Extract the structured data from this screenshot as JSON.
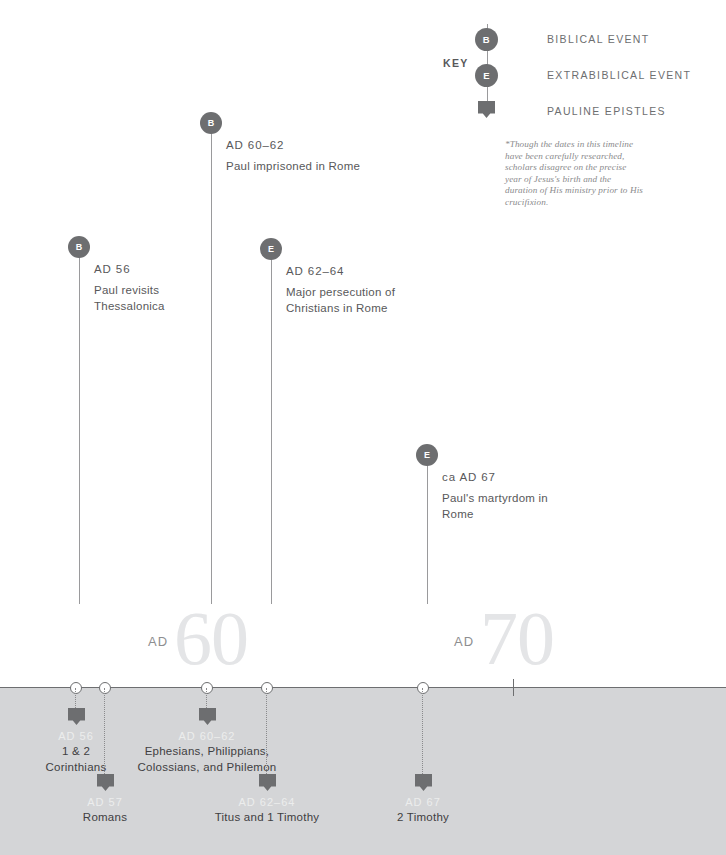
{
  "key": {
    "label": "KEY",
    "items": [
      {
        "icon": "biblical-event-badge",
        "glyph": "B",
        "text": "BIBLICAL EVENT"
      },
      {
        "icon": "extrabiblical-event-badge",
        "glyph": "E",
        "text": "EXTRABIBLICAL EVENT"
      },
      {
        "icon": "pauline-epistle-shield",
        "glyph": "",
        "text": "PAULINE EPISTLES"
      }
    ]
  },
  "footnote": "*Though the dates in this timeline have been carefully researched, scholars disagree on the precise year of Jesus's birth and the duration of His ministry prior to His crucifixion.",
  "events": [
    {
      "id": "paul-imprisoned-rome",
      "type": "B",
      "date": "AD 60–62",
      "description": "Paul imprisoned in Rome",
      "x": 200,
      "y": 112,
      "stem_height": 482
    },
    {
      "id": "paul-revisits-thessalonica",
      "type": "B",
      "date": "AD 56",
      "description": "Paul revisits Thessalonica",
      "x": 68,
      "y": 236,
      "stem_height": 358
    },
    {
      "id": "major-persecution-christians-rome",
      "type": "E",
      "date": "AD 62–64",
      "description": "Major persecution of Christians in Rome",
      "x": 260,
      "y": 238,
      "stem_height": 356
    },
    {
      "id": "pauls-martyrdom-rome",
      "type": "E",
      "date": "ca AD 67",
      "description": "Paul's martyrdom in Rome",
      "x": 416,
      "y": 444,
      "stem_height": 150
    }
  ],
  "decades": [
    {
      "id": "decade-60",
      "ad": "AD",
      "number": "60",
      "x": 148
    },
    {
      "id": "decade-70",
      "ad": "AD",
      "number": "70",
      "x": 454
    }
  ],
  "axis": {
    "nodes": [
      76,
      105,
      207,
      267,
      423
    ],
    "ticks": [
      514
    ]
  },
  "epistles": [
    {
      "id": "epistle-1-2-corinthians",
      "x": 76,
      "drop_height": 22,
      "marker_y": 708,
      "date": "AD 56",
      "date_y": 730,
      "name": "1 & 2\nCorinthians",
      "name_y": 744,
      "width": 110
    },
    {
      "id": "epistle-romans",
      "x": 105,
      "drop_height": 88,
      "marker_y": 774,
      "date": "AD 57",
      "date_y": 796,
      "name": "Romans",
      "name_y": 810,
      "width": 110
    },
    {
      "id": "epistle-ephesians-philippians-colossians-philemon",
      "x": 207,
      "drop_height": 22,
      "marker_y": 708,
      "date": "AD 60–62",
      "date_y": 730,
      "name": "Ephesians, Philippians,\nColossians, and Philemon",
      "name_y": 744,
      "width": 200
    },
    {
      "id": "epistle-titus-1-timothy",
      "x": 267,
      "drop_height": 88,
      "marker_y": 774,
      "date": "AD 62–64",
      "date_y": 796,
      "name": "Titus and 1 Timothy",
      "name_y": 810,
      "width": 170
    },
    {
      "id": "epistle-2-timothy",
      "x": 423,
      "drop_height": 88,
      "marker_y": 774,
      "date": "AD 67",
      "date_y": 796,
      "name": "2 Timothy",
      "name_y": 810,
      "width": 130
    }
  ],
  "colors": {
    "marker": "#6d6e70",
    "band": "#d4d5d7",
    "decade_number": "#e4e5e7",
    "text": "#58585a"
  }
}
